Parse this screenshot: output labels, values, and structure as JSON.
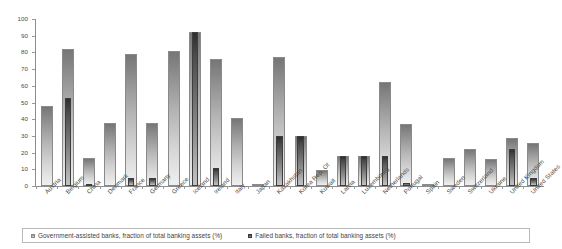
{
  "chart_data": {
    "type": "bar",
    "title": "",
    "xlabel": "",
    "ylabel": "",
    "ylim": [
      0,
      100
    ],
    "yticks": [
      0,
      10,
      20,
      30,
      40,
      50,
      60,
      70,
      80,
      90,
      100
    ],
    "grid": false,
    "legend_position": "bottom",
    "bar_style": "overlapping",
    "categories": [
      "Austria",
      "Belgium",
      "China",
      "Denmark",
      "France",
      "Germany",
      "Greece",
      "Iceland",
      "Ireland",
      "Italy",
      "Japan",
      "Kazakhstan",
      "Korea Rep. Of",
      "Kuwait",
      "Latvia",
      "Luxembourg",
      "Netherlands",
      "Portugal",
      "Spain",
      "Sweden",
      "Switzerland",
      "Ukraine",
      "United Kingdom",
      "United States"
    ],
    "series": [
      {
        "name": "Government-assisted banks, fraction of total banking assets (%)",
        "color": "#b4b4b4",
        "values": [
          48,
          82,
          17,
          38,
          79,
          38,
          81,
          92,
          76,
          41,
          0.6,
          77,
          30,
          9.5,
          18,
          18,
          62,
          37,
          0.8,
          17,
          22,
          16,
          29,
          26
        ]
      },
      {
        "name": "Failed banks, fraction of total banking assets (%)",
        "color": "#4c4c4c",
        "values": [
          0,
          53,
          1,
          0,
          5,
          5,
          0,
          92,
          11,
          0,
          0,
          30,
          30,
          0,
          18,
          18,
          18,
          2,
          0,
          0,
          0,
          0,
          22,
          5
        ]
      }
    ]
  },
  "legend": {
    "items": [
      {
        "marker": "square-swatch-light",
        "label": "Government-assisted banks, fraction of total banking assets (%)"
      },
      {
        "marker": "square-swatch-dark",
        "label": "Failed banks, fraction of total banking assets (%)"
      }
    ]
  }
}
